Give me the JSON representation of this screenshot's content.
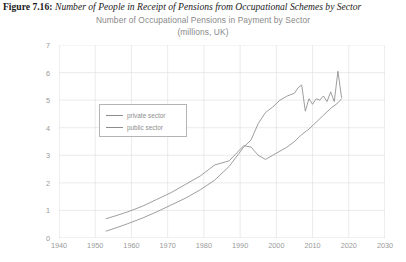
{
  "figure": {
    "label": "Figure 7.16",
    "separator": ":",
    "caption": "Number of People in Receipt of Pensions from Occupational Schemes by Sector"
  },
  "chart_data": {
    "type": "line",
    "title": "Number of Occupational Pensions in Payment by Sector",
    "subtitle": "(millions, UK)",
    "xlabel": "",
    "ylabel": "",
    "xlim": [
      1940,
      2030
    ],
    "ylim": [
      0,
      7
    ],
    "xticks": [
      1940,
      1950,
      1960,
      1970,
      1980,
      1990,
      2000,
      2010,
      2020,
      2030
    ],
    "yticks": [
      0,
      1,
      2,
      3,
      4,
      5,
      6,
      7
    ],
    "grid": true,
    "legend_position": "upper-left-inside",
    "line_color": "#8c8c8c",
    "series": [
      {
        "name": "private sector",
        "x": [
          1953,
          1956,
          1959,
          1963,
          1967,
          1971,
          1975,
          1979,
          1983,
          1987,
          1991,
          1993,
          1995,
          1997,
          1999,
          2001,
          2003,
          2005,
          2006,
          2007,
          2008,
          2009,
          2010,
          2011,
          2012,
          2013,
          2014,
          2015,
          2016,
          2017,
          2018
        ],
        "values": [
          0.25,
          0.38,
          0.52,
          0.72,
          0.95,
          1.2,
          1.45,
          1.75,
          2.1,
          2.6,
          3.3,
          3.55,
          4.15,
          4.55,
          4.75,
          5.0,
          5.15,
          5.25,
          5.45,
          5.55,
          4.6,
          5.05,
          4.85,
          5.05,
          5.0,
          5.15,
          4.95,
          5.3,
          4.95,
          6.05,
          5.1
        ]
      },
      {
        "name": "public sector",
        "x": [
          1953,
          1956,
          1959,
          1963,
          1967,
          1971,
          1975,
          1979,
          1983,
          1987,
          1991,
          1993,
          1995,
          1997,
          1999,
          2001,
          2003,
          2005,
          2007,
          2009,
          2011,
          2013,
          2015,
          2017,
          2018
        ],
        "values": [
          0.7,
          0.82,
          0.95,
          1.15,
          1.4,
          1.65,
          1.95,
          2.25,
          2.65,
          2.8,
          3.35,
          3.3,
          3.0,
          2.85,
          3.0,
          3.15,
          3.3,
          3.5,
          3.75,
          3.95,
          4.2,
          4.45,
          4.7,
          4.9,
          5.05
        ]
      }
    ]
  },
  "legend": {
    "items": [
      {
        "label": "private sector"
      },
      {
        "label": "public sector"
      }
    ]
  }
}
